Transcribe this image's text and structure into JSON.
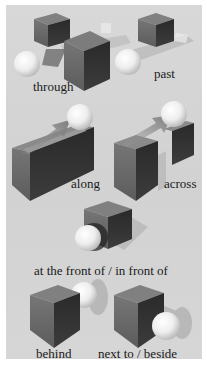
{
  "labels": {
    "through": "through",
    "past": "past",
    "along": "along",
    "across": "across",
    "in_front_of": "at the front of / in front of",
    "behind": "behind",
    "next_to": "next to / beside"
  },
  "colors": {
    "background": "#d5d5d5",
    "cube_top": "#7a7a7a",
    "cube_left": "#6a6a6a",
    "cube_right": "#2e2e2e",
    "sphere": "#f2f2f2",
    "shadow": "#b8b8b8"
  }
}
